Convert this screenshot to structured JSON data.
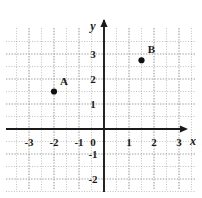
{
  "figure": {
    "kind": "cartesian-coordinate-plane",
    "background_color": "#ffffff",
    "axis_color": "#1a1a1a",
    "grid_color": "#9a9a9a",
    "label_color": "#1a1a1a",
    "point_color": "#111111"
  },
  "axes": {
    "x_axis_name": "x",
    "y_axis_name": "y",
    "origin_label": "0",
    "x_tick_labels": [
      "-3",
      "-2",
      "-1",
      "1",
      "2",
      "3"
    ],
    "y_tick_labels": [
      "3",
      "2",
      "1",
      "-1",
      "-2"
    ],
    "x_range": [
      -3.5,
      3.5
    ],
    "y_range": [
      -2.5,
      3.5
    ],
    "grid": "dotted",
    "grid_step": 1,
    "grid_minor_step": 0.5
  },
  "points": [
    {
      "label": "A",
      "x": -2,
      "y": 1.5
    },
    {
      "label": "B",
      "x": 1.5,
      "y": 2.75
    }
  ],
  "chart_data": {
    "type": "scatter",
    "title": "",
    "xlabel": "x",
    "ylabel": "y",
    "xlim": [
      -3.5,
      3.5
    ],
    "ylim": [
      -2.5,
      3.5
    ],
    "grid": true,
    "legend": "none",
    "series": [
      {
        "name": "plotted-points",
        "x": [
          -2,
          1.5
        ],
        "y": [
          1.5,
          2.75
        ],
        "labels": [
          "A",
          "B"
        ]
      }
    ]
  }
}
